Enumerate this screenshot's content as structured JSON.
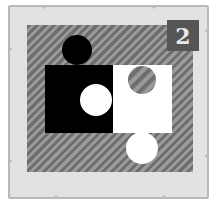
{
  "card": {
    "badge_number": "2",
    "title": "Puzzle tile"
  },
  "colors": {
    "frame_fill": "#e2e2e2",
    "frame_border": "#b9b9b9",
    "hatch_dark": "#6e6e6e",
    "hatch_light": "#9a9a9a",
    "badge_bg": "#555555",
    "badge_text": "#e8e8e8",
    "piece_black": "#000000",
    "piece_white": "#ffffff"
  },
  "pieces": [
    {
      "name": "black-piece",
      "color": "black"
    },
    {
      "name": "white-piece",
      "color": "white"
    }
  ]
}
